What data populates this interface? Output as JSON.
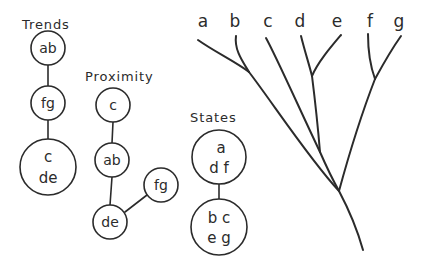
{
  "figure": {
    "background_color": "#ffffff",
    "ink_color": "#2b2b2b",
    "width": 422,
    "height": 269
  },
  "groups": {
    "trends": {
      "label": "Trends",
      "label_x": 22,
      "label_y": 24,
      "nodes": [
        {
          "id": "trends-ab",
          "lines": [
            "ab"
          ],
          "cx": 48,
          "cy": 48,
          "r": 17,
          "font_size": 14
        },
        {
          "id": "trends-fg",
          "lines": [
            "fg"
          ],
          "cx": 48,
          "cy": 103,
          "r": 17,
          "font_size": 14
        },
        {
          "id": "trends-cde",
          "lines": [
            "c",
            "de"
          ],
          "cx": 48,
          "cy": 167,
          "r": 28,
          "font_size": 15
        }
      ],
      "edges": [
        {
          "id": "trends-edge-ab-fg",
          "x1": 48,
          "y1": 65,
          "x2": 48,
          "y2": 86
        },
        {
          "id": "trends-edge-fg-cde",
          "x1": 48,
          "y1": 120,
          "x2": 48,
          "y2": 139
        }
      ]
    },
    "proximity": {
      "label": "Proximity",
      "label_x": 85,
      "label_y": 76,
      "nodes": [
        {
          "id": "proximity-c",
          "lines": [
            "c"
          ],
          "cx": 113,
          "cy": 105,
          "r": 17,
          "font_size": 14
        },
        {
          "id": "proximity-ab",
          "lines": [
            "ab"
          ],
          "cx": 112,
          "cy": 160,
          "r": 17,
          "font_size": 14
        },
        {
          "id": "proximity-de",
          "lines": [
            "de"
          ],
          "cx": 110,
          "cy": 222,
          "r": 17,
          "font_size": 14
        },
        {
          "id": "proximity-fg",
          "lines": [
            "fg"
          ],
          "cx": 161,
          "cy": 185,
          "r": 17,
          "font_size": 14
        }
      ],
      "edges": [
        {
          "id": "proximity-edge-c-ab",
          "x1": 113,
          "y1": 122,
          "x2": 112,
          "y2": 143
        },
        {
          "id": "proximity-edge-ab-de",
          "x1": 112,
          "y1": 177,
          "x2": 110,
          "y2": 205
        },
        {
          "id": "proximity-edge-de-fg",
          "x1": 125,
          "y1": 212,
          "x2": 147,
          "y2": 195
        }
      ]
    },
    "states": {
      "label": "States",
      "label_x": 190,
      "label_y": 117,
      "nodes": [
        {
          "id": "states-adf",
          "lines": [
            "a",
            "d f"
          ],
          "cx": 219,
          "cy": 157,
          "r": 27,
          "font_size": 15
        },
        {
          "id": "states-bceg",
          "lines": [
            "b c",
            "e g"
          ],
          "cx": 219,
          "cy": 227,
          "r": 28,
          "font_size": 15
        }
      ],
      "edges": [
        {
          "id": "states-edge-adf-bceg",
          "x1": 219,
          "y1": 184,
          "x2": 219,
          "y2": 199
        }
      ]
    }
  },
  "tree": {
    "leaves": [
      {
        "label": "a",
        "x": 203,
        "y": 21
      },
      {
        "label": "b",
        "x": 235,
        "y": 21
      },
      {
        "label": "c",
        "x": 268,
        "y": 21
      },
      {
        "label": "d",
        "x": 300,
        "y": 21
      },
      {
        "label": "e",
        "x": 337,
        "y": 21
      },
      {
        "label": "f",
        "x": 370,
        "y": 21
      },
      {
        "label": "g",
        "x": 399,
        "y": 21
      }
    ],
    "branches": [
      {
        "id": "branch-a",
        "path": "M 198 40 C 215 52 236 62 249 72"
      },
      {
        "id": "branch-b",
        "path": "M 236 36 C 234 50 243 62 249 72"
      },
      {
        "id": "branch-c",
        "path": "M 266 38 C 276 56 300 110 320 152"
      },
      {
        "id": "branch-d",
        "path": "M 301 36 C 305 52 309 64 312 76"
      },
      {
        "id": "branch-e",
        "path": "M 341 35 C 330 48 318 62 312 76"
      },
      {
        "id": "branch-f",
        "path": "M 368 34 C 368 52 371 68 375 79"
      },
      {
        "id": "branch-g",
        "path": "M 401 36 C 391 50 381 68 375 79"
      },
      {
        "id": "branch-ab-stem",
        "path": "M 249 72 C 272 102 310 160 339 191"
      },
      {
        "id": "branch-de-stem",
        "path": "M 312 76 C 315 100 318 128 320 152"
      },
      {
        "id": "branch-cde-stem",
        "path": "M 320 152 C 327 168 334 182 339 191"
      },
      {
        "id": "branch-fg-stem",
        "path": "M 375 79 C 363 110 348 158 339 191"
      },
      {
        "id": "branch-root",
        "path": "M 339 191 C 348 208 358 232 363 250"
      }
    ]
  }
}
